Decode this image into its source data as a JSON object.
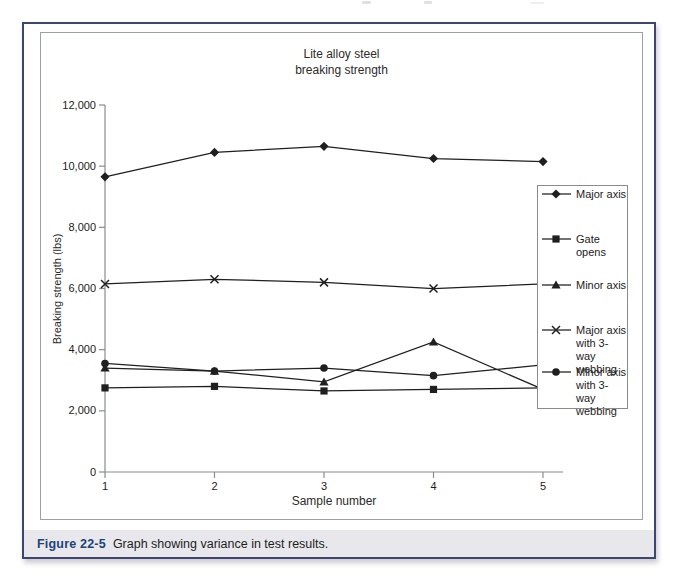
{
  "page": {
    "caption_label": "Figure 22-5",
    "caption_text": "Graph showing variance in test results."
  },
  "colors": {
    "outer_border": "#3d4570",
    "inner_border": "#9aa0a6",
    "caption_bg": "#e7e7ec",
    "caption_accent": "#1d4477",
    "data_line": "#1f1f1f",
    "axis_line": "#8c8c8c"
  },
  "chart_data": {
    "type": "line",
    "title_line1": "Lite alloy steel",
    "title_line2": "breaking strength",
    "xlabel": "Sample number",
    "ylabel": "Breaking strength (lbs)",
    "grid": false,
    "legend_position": "right-overlay",
    "x": [
      1,
      2,
      3,
      4,
      5
    ],
    "x_tick_labels": [
      "1",
      "2",
      "3",
      "4",
      "5"
    ],
    "ylim": [
      0,
      12000
    ],
    "y_ticks": [
      0,
      2000,
      4000,
      6000,
      8000,
      10000,
      12000
    ],
    "y_tick_labels": [
      "0",
      "2,000",
      "4,000",
      "6,000",
      "8,000",
      "10,000",
      "12,000"
    ],
    "series": [
      {
        "name": "Major axis",
        "marker": "diamond",
        "legend_lines": [
          "Major axis"
        ],
        "values": [
          9650,
          10450,
          10650,
          10250,
          10150
        ]
      },
      {
        "name": "Gate opens",
        "marker": "square",
        "legend_lines": [
          "Gate opens"
        ],
        "values": [
          2750,
          2800,
          2650,
          2700,
          2750
        ]
      },
      {
        "name": "Minor axis",
        "marker": "triangle",
        "legend_lines": [
          "Minor axis"
        ],
        "values": [
          3400,
          3300,
          2950,
          4250,
          2700
        ]
      },
      {
        "name": "Major axis with 3-way webbing",
        "marker": "x",
        "legend_lines": [
          "Major axis",
          "with 3-way",
          "webbing"
        ],
        "values": [
          6150,
          6300,
          6200,
          6000,
          6150
        ]
      },
      {
        "name": "Minor axis with 3-way webbing",
        "marker": "circle",
        "legend_lines": [
          "Minor axis",
          "with 3-way",
          "webbing"
        ],
        "values": [
          3550,
          3300,
          3400,
          3150,
          3500
        ]
      }
    ]
  }
}
